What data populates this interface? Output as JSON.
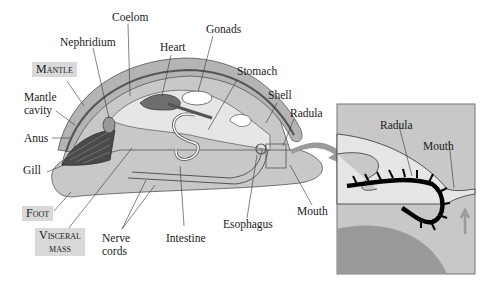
{
  "diagram": {
    "type": "mollusc-anatomy",
    "labels": {
      "coelom": "Coelom",
      "nephridium": "Nephridium",
      "heart": "Heart",
      "gonads": "Gonads",
      "mantle": "Mantle",
      "stomach": "Stomach",
      "mantle_cavity_1": "Mantle",
      "mantle_cavity_2": "cavity",
      "shell": "Shell",
      "radula": "Radula",
      "anus": "Anus",
      "gill": "Gill",
      "foot": "Foot",
      "visceral_mass_1": "Visceral",
      "visceral_mass_2": "mass",
      "nerve_cords_1": "Nerve",
      "nerve_cords_2": "cords",
      "intestine": "Intestine",
      "esophagus": "Esophagus",
      "mouth": "Mouth"
    },
    "inset": {
      "radula": "Radula",
      "mouth": "Mouth"
    },
    "colors": {
      "body": "#c8c8c8",
      "shell": "#b4b4b4",
      "light": "#e6e6e6",
      "dark": "#6e6e6e",
      "label_box": "#d9d9d9",
      "arrow": "#9a9a9a"
    }
  }
}
